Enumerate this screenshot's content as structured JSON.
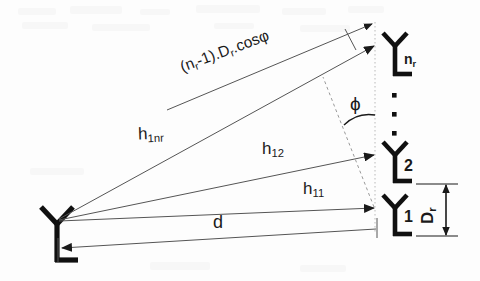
{
  "figure": {
    "background_color": "#fdfdfd",
    "ink_color": "#1a1a1a",
    "line_color": "#555555"
  },
  "labels": {
    "path_difference": "(n",
    "path_difference_sub1": "r",
    "path_difference_mid": "-1).D",
    "path_difference_sub2": "r",
    "path_difference_end": ".cosφ",
    "angle": "ϕ",
    "distance": "d",
    "spacing": "D",
    "spacing_sub": "r",
    "h11": "h",
    "h11_sub": "11",
    "h12": "h",
    "h12_sub": "12",
    "h1nr": "h",
    "h1nr_sub": "1nr"
  },
  "antennas": {
    "transmitter": {
      "name": "transmit-antenna",
      "label": ""
    },
    "receivers": [
      {
        "name": "receive-antenna-nr",
        "label": "n",
        "sub": "r"
      },
      {
        "name": "receive-antenna-2",
        "label": "2",
        "sub": ""
      },
      {
        "name": "receive-antenna-1",
        "label": "1",
        "sub": ""
      }
    ],
    "ellipsis_dots": 3
  },
  "geometry": {
    "transmitter_point": [
      57,
      222
    ],
    "array_axis_x": 375,
    "receiver_points": [
      [
        375,
        46
      ],
      [
        375,
        155
      ],
      [
        375,
        208
      ]
    ],
    "angle_degrees": 20.5
  }
}
